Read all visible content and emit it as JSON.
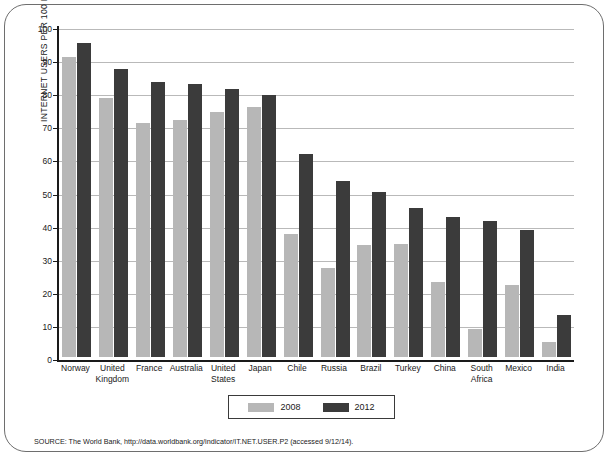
{
  "chart_data": {
    "type": "bar",
    "title": "",
    "xlabel": "",
    "ylabel": "INTERNET USERS PER 100 PEOPLE",
    "ylim": [
      0,
      100
    ],
    "ytick_step": 10,
    "yticks": [
      "0",
      "10",
      "20",
      "30",
      "40",
      "50",
      "60",
      "70",
      "80",
      "90",
      "100"
    ],
    "grid": true,
    "legend_position": "bottom-center",
    "categories": [
      "Norway",
      "United\nKingdom",
      "France",
      "Australia",
      "United\nStates",
      "Japan",
      "Chile",
      "Russia",
      "Brazil",
      "Turkey",
      "China",
      "South\nAfrica",
      "Mexico",
      "India"
    ],
    "series": [
      {
        "name": "2008",
        "color": "#b7b7b7",
        "values": [
          90.6,
          78.4,
          70.7,
          71.7,
          74.0,
          75.4,
          37.3,
          26.8,
          33.8,
          34.0,
          22.6,
          8.4,
          21.7,
          4.4
        ]
      },
      {
        "name": "2012",
        "color": "#3b3b3b",
        "values": [
          95.0,
          87.0,
          83.0,
          82.4,
          81.0,
          79.1,
          61.4,
          53.3,
          49.8,
          45.1,
          42.3,
          41.0,
          38.4,
          12.6
        ]
      }
    ]
  },
  "legend": {
    "items": [
      {
        "label": "2008",
        "color": "#b7b7b7"
      },
      {
        "label": "2012",
        "color": "#3b3b3b"
      }
    ]
  },
  "source": {
    "text": "SOURCE: The World Bank, http://data.worldbank.org/indicator/IT.NET.USER.P2 (accessed 9/12/14)."
  }
}
